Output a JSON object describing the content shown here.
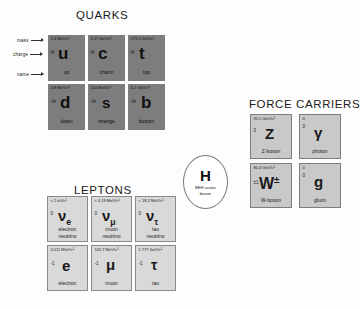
{
  "headings": {
    "quarks": "QUARKS",
    "leptons": "LEPTONS",
    "force_carriers": "FORCE CARRIERS"
  },
  "annotations": {
    "mass": "mass",
    "charge": "charge",
    "name": "name"
  },
  "colors": {
    "quark_bg": "#7d7d7d",
    "lepton_bg": "#d9d9d9",
    "boson_bg": "#c9c9c9",
    "page_bg": "#fdfdfd",
    "text": "#111111"
  },
  "quarks": [
    {
      "mass": "2.4 MeV/c²",
      "charge": "⅔",
      "symbol": "u",
      "name": "up"
    },
    {
      "mass": "1.27 GeV/c²",
      "charge": "⅔",
      "symbol": "c",
      "name": "charm"
    },
    {
      "mass": "171.2 GeV/c²",
      "charge": "⅔",
      "symbol": "t",
      "name": "top"
    },
    {
      "mass": "4.8 MeV/c²",
      "charge": "-⅓",
      "symbol": "d",
      "name": "down"
    },
    {
      "mass": "104 MeV/c²",
      "charge": "-⅓",
      "symbol": "s",
      "name": "strange"
    },
    {
      "mass": "4.2 GeV/c²",
      "charge": "-⅓",
      "symbol": "b",
      "name": "bottom"
    }
  ],
  "leptons": [
    {
      "mass": "< 2 eV/c²",
      "charge": "0",
      "symbol": "ν",
      "subscript": "e",
      "name_line1": "electron",
      "name_line2": "neutrino"
    },
    {
      "mass": "< 0.19 MeV/c²",
      "charge": "0",
      "symbol": "ν",
      "subscript": "μ",
      "name_line1": "muon",
      "name_line2": "neutrino"
    },
    {
      "mass": "< 18.2 MeV/c²",
      "charge": "0",
      "symbol": "ν",
      "subscript": "τ",
      "name_line1": "tau",
      "name_line2": "neutrino"
    },
    {
      "mass": "0.511 MeV/c²",
      "charge": "-1",
      "symbol": "e",
      "subscript": "",
      "name_line1": "electron",
      "name_line2": ""
    },
    {
      "mass": "105.7 MeV/c²",
      "charge": "-1",
      "symbol": "μ",
      "subscript": "",
      "name_line1": "muon",
      "name_line2": ""
    },
    {
      "mass": "1.777 GeV/c²",
      "charge": "-1",
      "symbol": "τ",
      "subscript": "",
      "name_line1": "tau",
      "name_line2": ""
    }
  ],
  "force_carriers": [
    {
      "mass": "91.2 GeV/c²",
      "charge": "0",
      "symbol": "Z",
      "name": "Z-boson"
    },
    {
      "mass": "0",
      "charge": "0",
      "symbol": "γ",
      "name": "photon"
    },
    {
      "mass": "80.4 GeV/c²",
      "charge": "±1",
      "symbol": "W",
      "superscript": "±",
      "name": "W-boson"
    },
    {
      "mass": "0",
      "charge": "0",
      "symbol": "g",
      "name": "gluon"
    }
  ],
  "higgs": {
    "symbol": "H",
    "description_line1": "BEH scalar",
    "description_line2": "boson"
  }
}
